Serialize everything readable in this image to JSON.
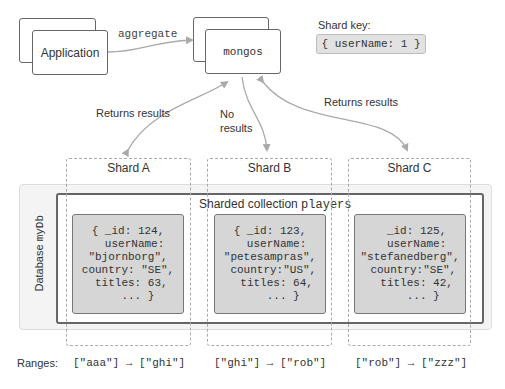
{
  "application": {
    "label": "Application"
  },
  "aggregate": {
    "label": "aggregate"
  },
  "mongos": {
    "label": "mongos"
  },
  "shard_key": {
    "title": "Shard key:",
    "value": "{ userName: 1 }"
  },
  "arrows": {
    "shard_a": "Returns results",
    "shard_b_line1": "No",
    "shard_b_line2": "results",
    "shard_c": "Returns results"
  },
  "database": {
    "label_prefix": "Database ",
    "name": "myDb"
  },
  "collection": {
    "label_prefix": "Sharded collection ",
    "name": "players"
  },
  "shards": [
    {
      "name": "Shard A",
      "document": "{ _id: 124,\n  userName:\n\"bjornborg\",\ncountry: \"SE\",\n titles: 63,\n   ... }",
      "range": "[\"aaa\"] → [\"ghi\"]"
    },
    {
      "name": "Shard B",
      "document": "{ _id: 123,\n  userName:\n\"petesampras\",\n country:\"US\",\n  titles: 64,\n    ... }",
      "range": "[\"ghi\"] → [\"rob\"]"
    },
    {
      "name": "Shard C",
      "document": "  _id: 125,\n  userName:\n\"stefanedberg\",\n country:\"SE\",\n  titles: 42,\n    ... }",
      "range": "[\"rob\"] → [\"zzz\"]"
    }
  ],
  "ranges_label": "Ranges:"
}
